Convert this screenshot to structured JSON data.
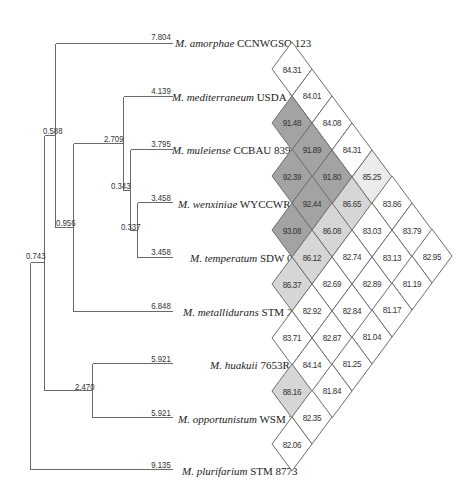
{
  "tree": {
    "taxa": [
      {
        "genus": "M.",
        "species": "amorphae",
        "strain": "CCNWGSO 123",
        "branch_length": "7.804",
        "y": 41,
        "label_x": 175
      },
      {
        "genus": "M.",
        "species": "mediterraneum",
        "strain": "USDA 3392",
        "branch_length": "4.139",
        "y": 95,
        "label_x": 172
      },
      {
        "genus": "M.",
        "species": "muleiense",
        "strain": "CCBAU 83963",
        "branch_length": "3.795",
        "y": 148,
        "label_x": 172
      },
      {
        "genus": "M.",
        "species": "wenxiniae",
        "strain": "WYCCWR 10195",
        "branch_length": "3.458",
        "y": 202,
        "label_x": 178
      },
      {
        "genus": "M.",
        "species": "temperatum",
        "strain": "SDW 018",
        "branch_length": "3.458",
        "y": 256,
        "label_x": 190
      },
      {
        "genus": "M.",
        "species": "metallidurans",
        "strain": "STM 2683",
        "branch_length": "6.848",
        "y": 310,
        "label_x": 183
      },
      {
        "genus": "M.",
        "species": "huakuii",
        "strain": "7653R",
        "branch_length": "5.921",
        "y": 363,
        "label_x": 210
      },
      {
        "genus": "M.",
        "species": "opportunistum",
        "strain": "WSM 2075",
        "branch_length": "5.921",
        "y": 417,
        "label_x": 178
      },
      {
        "genus": "M.",
        "species": "plurifarium",
        "strain": "STM 8773",
        "branch_length": "9.135",
        "y": 469,
        "label_x": 182
      }
    ],
    "internal_nodes": [
      {
        "value": "0.588",
        "x": 43,
        "y": 133
      },
      {
        "value": "2.709",
        "x": 104,
        "y": 141
      },
      {
        "value": "0.343",
        "x": 111,
        "y": 188
      },
      {
        "value": "0.956",
        "x": 56,
        "y": 225
      },
      {
        "value": "0.337",
        "x": 121,
        "y": 229
      },
      {
        "value": "0.743",
        "x": 26,
        "y": 258
      },
      {
        "value": "2.470",
        "x": 75,
        "y": 389
      }
    ]
  },
  "matrix": {
    "colors": {
      "high": "#a3a3a3",
      "mid": "#d6d6d6",
      "low": "#ebebeb",
      "none": "#ffffff",
      "border": "#6e6e6e"
    },
    "cells": [
      {
        "i": 0,
        "j": 1,
        "value": "84.31",
        "shade": "none"
      },
      {
        "i": 0,
        "j": 2,
        "value": "84.01",
        "shade": "none"
      },
      {
        "i": 0,
        "j": 3,
        "value": "84.08",
        "shade": "none"
      },
      {
        "i": 0,
        "j": 4,
        "value": "84.31",
        "shade": "none"
      },
      {
        "i": 0,
        "j": 5,
        "value": "85.25",
        "shade": "low"
      },
      {
        "i": 0,
        "j": 6,
        "value": "83.86",
        "shade": "none"
      },
      {
        "i": 0,
        "j": 7,
        "value": "83.79",
        "shade": "none"
      },
      {
        "i": 0,
        "j": 8,
        "value": "82.95",
        "shade": "none"
      },
      {
        "i": 1,
        "j": 2,
        "value": "91.48",
        "shade": "high"
      },
      {
        "i": 1,
        "j": 3,
        "value": "91.89",
        "shade": "high"
      },
      {
        "i": 1,
        "j": 4,
        "value": "91.80",
        "shade": "high"
      },
      {
        "i": 1,
        "j": 5,
        "value": "86.65",
        "shade": "mid"
      },
      {
        "i": 1,
        "j": 6,
        "value": "83.03",
        "shade": "none"
      },
      {
        "i": 1,
        "j": 7,
        "value": "83.13",
        "shade": "none"
      },
      {
        "i": 1,
        "j": 8,
        "value": "81.19",
        "shade": "none"
      },
      {
        "i": 2,
        "j": 3,
        "value": "92.39",
        "shade": "high"
      },
      {
        "i": 2,
        "j": 4,
        "value": "92.44",
        "shade": "high"
      },
      {
        "i": 2,
        "j": 5,
        "value": "86.08",
        "shade": "mid"
      },
      {
        "i": 2,
        "j": 6,
        "value": "82.74",
        "shade": "none"
      },
      {
        "i": 2,
        "j": 7,
        "value": "82.89",
        "shade": "none"
      },
      {
        "i": 2,
        "j": 8,
        "value": "81.17",
        "shade": "none"
      },
      {
        "i": 3,
        "j": 4,
        "value": "93.08",
        "shade": "high"
      },
      {
        "i": 3,
        "j": 5,
        "value": "86.12",
        "shade": "mid"
      },
      {
        "i": 3,
        "j": 6,
        "value": "82.69",
        "shade": "none"
      },
      {
        "i": 3,
        "j": 7,
        "value": "82.84",
        "shade": "none"
      },
      {
        "i": 3,
        "j": 8,
        "value": "81.04",
        "shade": "none"
      },
      {
        "i": 4,
        "j": 5,
        "value": "86.37",
        "shade": "mid"
      },
      {
        "i": 4,
        "j": 6,
        "value": "82.92",
        "shade": "none"
      },
      {
        "i": 4,
        "j": 7,
        "value": "82.87",
        "shade": "none"
      },
      {
        "i": 4,
        "j": 8,
        "value": "81.25",
        "shade": "none"
      },
      {
        "i": 5,
        "j": 6,
        "value": "83.71",
        "shade": "none"
      },
      {
        "i": 5,
        "j": 7,
        "value": "84.14",
        "shade": "none"
      },
      {
        "i": 5,
        "j": 8,
        "value": "81.84",
        "shade": "none"
      },
      {
        "i": 6,
        "j": 7,
        "value": "88.16",
        "shade": "mid"
      },
      {
        "i": 6,
        "j": 8,
        "value": "82.35",
        "shade": "none"
      },
      {
        "i": 7,
        "j": 8,
        "value": "82.06",
        "shade": "none"
      }
    ]
  }
}
